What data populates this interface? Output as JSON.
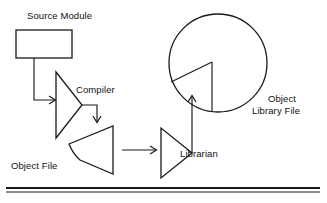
{
  "diagram": {
    "title_text": "Compilation and library build flow",
    "stroke_color": "#1a1a1a",
    "background_color": "#ffffff",
    "nodes": {
      "source_module": {
        "label": "Source Module",
        "shape": "rectangle",
        "x": 16,
        "y": 30,
        "width": 56,
        "height": 28
      },
      "compiler": {
        "label": "Compiler",
        "shape": "triangle-right",
        "points": "56,72 56,138 82,105"
      },
      "object_file": {
        "label": "Object File",
        "shape": "wedge",
        "points": "77,146 113,127 113,173 77,160"
      },
      "librarian": {
        "label": "Librarian",
        "shape": "triangle-right",
        "points": "161,128 161,178 192,153"
      },
      "object_library_file": {
        "label_line_1": "Object",
        "label_line_2": "Library File",
        "shape": "circle-with-wedge",
        "cx": 218,
        "cy": 63,
        "r": 49
      }
    },
    "connectors": [
      {
        "name": "source-to-compiler",
        "from": "source_module",
        "to": "compiler",
        "direction": "down-then-right",
        "arrow": true
      },
      {
        "name": "compiler-to-object-file",
        "from": "compiler",
        "to": "object_file",
        "direction": "right-then-down",
        "arrow": true
      },
      {
        "name": "object-file-to-librarian",
        "from": "object_file",
        "to": "librarian",
        "direction": "right",
        "arrow": true
      },
      {
        "name": "librarian-to-object-library-file",
        "from": "librarian",
        "to": "object_library_file",
        "direction": "right-then-up",
        "arrow": true
      }
    ],
    "footer_rule": {
      "name": "horizontal-rule",
      "y": 188,
      "x_start": 6,
      "x_end": 320
    }
  }
}
